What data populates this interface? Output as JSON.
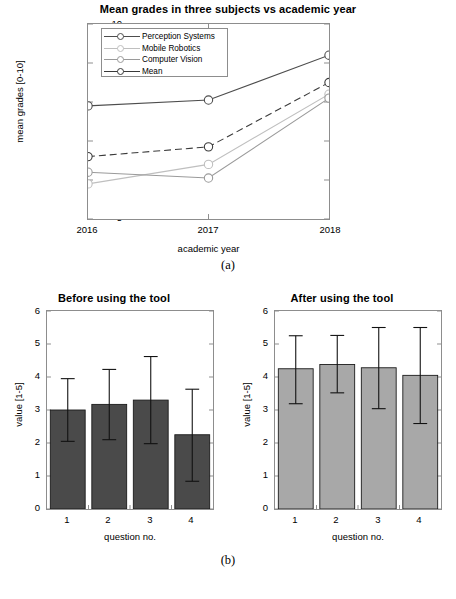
{
  "figure": {
    "caption_a": "(a)",
    "caption_b": "(b)"
  },
  "chart_data": [
    {
      "id": "mean-grades",
      "type": "line",
      "title": "Mean grades in three subjects vs academic year",
      "xlabel": "academic year",
      "ylabel": "mean grades [0-10]",
      "x": [
        "2016",
        "2017",
        "2018"
      ],
      "xticklabels": [
        "2016",
        "2017",
        "2018"
      ],
      "yticklabels": [
        "5",
        "6",
        "7",
        "8",
        "9",
        "10"
      ],
      "ylim": [
        5,
        10
      ],
      "grid": false,
      "legend_position": "upper left",
      "series": [
        {
          "name": "Perception Systems",
          "values": [
            7.9,
            8.05,
            9.2
          ],
          "color": "#4d4d4d",
          "dash": "solid"
        },
        {
          "name": "Mobile Robotics",
          "values": [
            5.9,
            6.4,
            8.2
          ],
          "color": "#bfbfbf",
          "dash": "solid"
        },
        {
          "name": "Computer Vision",
          "values": [
            6.2,
            6.05,
            8.1
          ],
          "color": "#9a9a9a",
          "dash": "solid"
        },
        {
          "name": "Mean",
          "values": [
            6.6,
            6.85,
            8.5
          ],
          "color": "#3a3a3a",
          "dash": "dashed"
        }
      ]
    },
    {
      "id": "before-tool",
      "type": "bar",
      "title": "Before using the tool",
      "xlabel": "question no.",
      "ylabel": "value [1-5]",
      "categories": [
        "1",
        "2",
        "3",
        "4"
      ],
      "xticklabels": [
        "1",
        "2",
        "3",
        "4"
      ],
      "yticklabels": [
        "0",
        "1",
        "2",
        "3",
        "4",
        "5",
        "6"
      ],
      "ylim": [
        0,
        6
      ],
      "grid": false,
      "bar_color": "#4a4a4a",
      "values": [
        3.0,
        3.17,
        3.3,
        2.25
      ],
      "err_low": [
        2.05,
        2.1,
        1.98,
        0.84
      ],
      "err_high": [
        3.95,
        4.23,
        4.62,
        3.63
      ]
    },
    {
      "id": "after-tool",
      "type": "bar",
      "title": "After using the tool",
      "xlabel": "question no.",
      "ylabel": "value [1-5]",
      "categories": [
        "1",
        "2",
        "3",
        "4"
      ],
      "xticklabels": [
        "1",
        "2",
        "3",
        "4"
      ],
      "yticklabels": [
        "0",
        "1",
        "2",
        "3",
        "4",
        "5",
        "6"
      ],
      "ylim": [
        0,
        6
      ],
      "grid": false,
      "bar_color": "#a8a8a8",
      "values": [
        4.25,
        4.38,
        4.28,
        4.05
      ],
      "err_low": [
        3.19,
        3.52,
        3.04,
        2.59
      ],
      "err_high": [
        5.25,
        5.26,
        5.5,
        5.5
      ]
    }
  ]
}
